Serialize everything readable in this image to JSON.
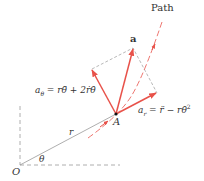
{
  "diagram": {
    "labels": {
      "path": "Path",
      "a": "a",
      "a_theta": "aθ = rθ̈ + 2ṙθ̇",
      "a_theta_sym": "a",
      "a_theta_sub": "θ",
      "a_theta_eq": " = rθ̈ + 2ṙθ̇",
      "a_r_sym": "a",
      "a_r_sub": "r",
      "a_r_eq": " = r̈ − rθ̇",
      "a_r_sup": "2",
      "point": "A",
      "radius": "r",
      "angle": "θ",
      "origin": "O"
    },
    "colors": {
      "vector": "#e8524a",
      "path": "#e8524a",
      "construction": "#888888",
      "text": "#333333"
    }
  }
}
